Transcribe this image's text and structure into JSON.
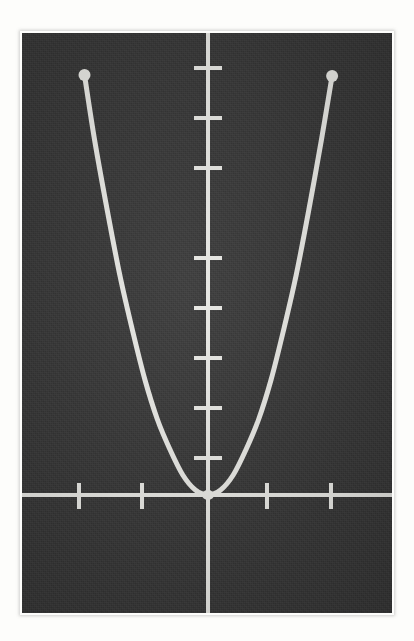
{
  "figure": {
    "kind": "photograph-of-graph",
    "background_color": "#fdfdfb",
    "plot_field_color": "#3a3a3a",
    "ink_color": "#e8e8e4",
    "caption": ""
  },
  "chart_data": {
    "type": "line",
    "title": "",
    "subtitle": "",
    "xlabel": "",
    "ylabel": "",
    "grid": false,
    "legend": [],
    "legend_position": "none",
    "annotations": [],
    "axes": {
      "x_axis_pixel_y": 495,
      "y_axis_pixel_x": 208,
      "x_tick_pixels": [
        79,
        142,
        267,
        331
      ],
      "y_tick_pixels": [
        68,
        118,
        168,
        258,
        308,
        358,
        408,
        458
      ],
      "x_tick_labels": [
        "-2",
        "-1",
        "1",
        "2"
      ],
      "y_tick_labels": [
        "8",
        "7",
        "6",
        "4",
        "3",
        "2",
        "1",
        ""
      ],
      "xlim": [
        -2.95,
        2.95
      ],
      "ylim": [
        -1.6,
        8.7
      ],
      "x_units_per_tick": 1,
      "y_units_per_tick": 1,
      "ticks_labeled": false
    },
    "curve": {
      "name": "parabola",
      "equation": "y = x^2",
      "vertex": [
        0,
        0
      ],
      "endpoints": [
        [
          -1.96,
          8.4
        ],
        [
          1.97,
          8.38
        ]
      ],
      "endpoint_markers": "round-dot",
      "x": [
        -1.96,
        -1.8,
        -1.6,
        -1.4,
        -1.2,
        -1.0,
        -0.8,
        -0.6,
        -0.4,
        -0.2,
        0,
        0.2,
        0.4,
        0.6,
        0.8,
        1.0,
        1.2,
        1.4,
        1.6,
        1.8,
        1.97
      ],
      "y": [
        8.4,
        7.1,
        5.7,
        4.4,
        3.3,
        2.3,
        1.5,
        0.9,
        0.4,
        0.1,
        0,
        0.1,
        0.4,
        0.9,
        1.5,
        2.3,
        3.3,
        4.4,
        5.7,
        7.1,
        8.38
      ],
      "stroke_width_px": 5,
      "marker_radius_px": 6
    }
  }
}
